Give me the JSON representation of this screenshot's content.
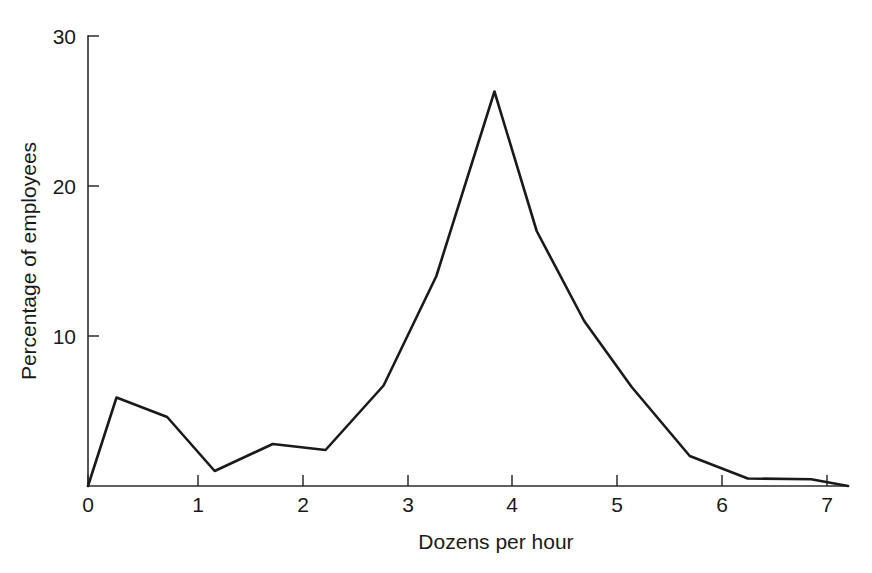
{
  "chart_data": {
    "type": "line",
    "title": "",
    "xlabel": "Dozens per hour",
    "ylabel": "Percentage of employees",
    "xlim": [
      0,
      7.45
    ],
    "ylim": [
      0,
      30
    ],
    "grid": false,
    "legend": "none",
    "xticks": [
      0,
      1,
      2,
      3,
      4,
      5,
      6,
      7
    ],
    "xtick_labels": [
      "0",
      "1",
      "2",
      "3",
      "4",
      "5",
      "6",
      "7"
    ],
    "yticks": [
      10,
      20,
      30
    ],
    "ytick_labels": [
      "10",
      "20",
      "30"
    ],
    "line_color": "#1a1a1a",
    "axis_color": "#2b2b2b",
    "series": [
      {
        "name": "Percentage of employees",
        "x": [
          0.0,
          0.27,
          0.75,
          1.2,
          1.75,
          2.25,
          2.8,
          3.3,
          3.85,
          4.25,
          4.7,
          5.15,
          5.7,
          6.25,
          6.85,
          7.2
        ],
        "y": [
          0.0,
          5.9,
          4.6,
          1.0,
          2.8,
          2.4,
          6.7,
          14.0,
          26.3,
          17.0,
          11.0,
          6.6,
          2.0,
          0.5,
          0.45,
          0.0
        ]
      }
    ]
  }
}
